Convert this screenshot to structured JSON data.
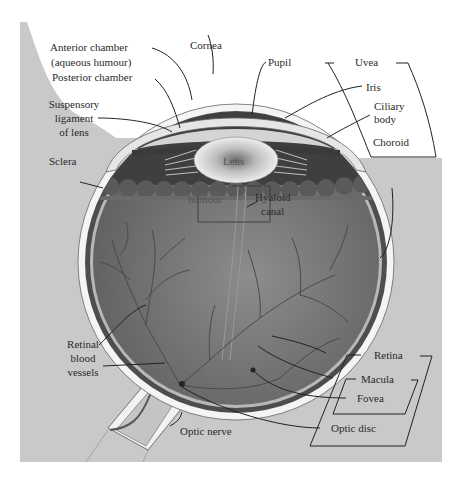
{
  "diagram": {
    "colors": {
      "background_panel": "#c9c9c9",
      "page": "#ffffff",
      "vitreous": "#7a7a7a",
      "choroid": "#4a4a4a",
      "sclera": "#f4f4f4",
      "lens": "#e8e8e8",
      "leader_line": "#222222"
    },
    "labels": {
      "anterior_chamber_1": "Anterior chamber",
      "anterior_chamber_2": "(aqueous humour)",
      "posterior_chamber": "Posterior chamber",
      "cornea": "Cornea",
      "pupil": "Pupil",
      "uvea": "Uvea",
      "iris": "Iris",
      "ciliary_body_1": "Ciliary",
      "ciliary_body_2": "body",
      "choroid": "Choroid",
      "suspensory_1": "Suspensory",
      "suspensory_2": "ligament",
      "suspensory_3": "of lens",
      "sclera": "Sclera",
      "lens": "Lens",
      "vitreous_1": "Vitreous",
      "vitreous_2": "humour",
      "hyaloid_1": "Hyaloid",
      "hyaloid_2": "canal",
      "retinal_vessels_1": "Retinal",
      "retinal_vessels_2": "blood",
      "retinal_vessels_3": "vessels",
      "retina": "Retina",
      "macula": "Macula",
      "fovea": "Fovea",
      "optic_nerve": "Optic nerve",
      "optic_disc": "Optic disc"
    }
  }
}
